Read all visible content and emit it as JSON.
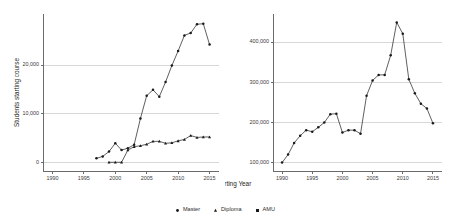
{
  "figure": {
    "xlabel": "Starting Year",
    "legend_position": "bottom-center"
  },
  "legend": {
    "items": [
      {
        "label": "Master",
        "marker": "dot",
        "color": "#1a1a1a"
      },
      {
        "label": "Diploma",
        "marker": "triangle",
        "color": "#1a1a1a"
      },
      {
        "label": "AMU",
        "marker": "square",
        "color": "#1a1a1a"
      }
    ]
  },
  "chart_data": [
    {
      "type": "line",
      "panel": "left",
      "title": "",
      "xlabel": "Starting Year",
      "ylabel": "Students starting course",
      "xlim": [
        1988.5,
        2016.5
      ],
      "ylim": [
        -1800,
        30500
      ],
      "xticks": [
        1990,
        1995,
        2000,
        2005,
        2010,
        2015
      ],
      "xticklabels": [
        "1990",
        "1995",
        "2000",
        "2005",
        "2010",
        "2015"
      ],
      "yticks": [
        0,
        10000,
        20000
      ],
      "yticklabels": [
        "0",
        "10,000",
        "20,000"
      ],
      "grid": true,
      "grid_axis": "y",
      "legend_entries": [
        "Master",
        "Diploma"
      ],
      "series": [
        {
          "name": "Master",
          "marker": "dot",
          "x": [
            1997,
            1998,
            1999,
            2000,
            2001,
            2002,
            2003,
            2004,
            2005,
            2006,
            2007,
            2008,
            2009,
            2010,
            2011,
            2012,
            2013,
            2014,
            2015
          ],
          "values": [
            800,
            1200,
            2200,
            3900,
            2500,
            2900,
            3600,
            9000,
            13700,
            14900,
            13500,
            16500,
            19900,
            22900,
            26100,
            26600,
            28400,
            28500,
            24200
          ]
        },
        {
          "name": "Diploma",
          "marker": "triangle",
          "x": [
            1999,
            2000,
            2001,
            2002,
            2003,
            2004,
            2005,
            2006,
            2007,
            2008,
            2009,
            2010,
            2011,
            2012,
            2013,
            2014,
            2015
          ],
          "values": [
            0,
            0,
            0,
            2500,
            3200,
            3400,
            3700,
            4300,
            4300,
            3900,
            4000,
            4400,
            4700,
            5500,
            5100,
            5200,
            5200
          ]
        }
      ]
    },
    {
      "type": "line",
      "panel": "right",
      "title": "",
      "xlabel": "Starting Year",
      "ylabel": "",
      "xlim": [
        1988.5,
        2016.5
      ],
      "ylim": [
        78000,
        470000
      ],
      "xticks": [
        1990,
        1995,
        2000,
        2005,
        2010,
        2015
      ],
      "xticklabels": [
        "1990",
        "1995",
        "2000",
        "2005",
        "2010",
        "2015"
      ],
      "yticks": [
        100000,
        200000,
        300000,
        400000
      ],
      "yticklabels": [
        "100,000",
        "200,000",
        "300,000",
        "400,000"
      ],
      "grid": true,
      "grid_axis": "y",
      "legend_entries": [
        "AMU"
      ],
      "series": [
        {
          "name": "AMU",
          "marker": "dot",
          "x": [
            1990,
            1991,
            1992,
            1993,
            1994,
            1995,
            1996,
            1997,
            1998,
            1999,
            2000,
            2001,
            2002,
            2003,
            2004,
            2005,
            2006,
            2007,
            2008,
            2009,
            2010,
            2011,
            2012,
            2013,
            2014,
            2015
          ],
          "values": [
            99000,
            119000,
            148000,
            166000,
            180000,
            176000,
            187000,
            199000,
            220000,
            221000,
            174000,
            180000,
            180000,
            171000,
            266000,
            304000,
            318000,
            318000,
            367000,
            449000,
            421000,
            307000,
            272000,
            246000,
            234000,
            197000
          ]
        }
      ]
    }
  ]
}
